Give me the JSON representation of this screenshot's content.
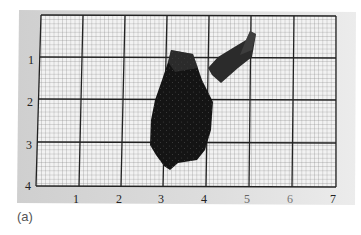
{
  "figure": {
    "caption": "(a)",
    "paper_color": "#d9d9d9",
    "grid_color": "#222222",
    "specimen_color": "#1a1a1a",
    "grid": {
      "columns": 7,
      "rows": 4,
      "x_labels": [
        "1",
        "2",
        "3",
        "4",
        "5",
        "6",
        "7"
      ],
      "y_labels": [
        "1",
        "2",
        "3",
        "4"
      ]
    },
    "objects": [
      {
        "name": "large-fragment",
        "label": "large dark fragment"
      },
      {
        "name": "small-fragment",
        "label": "small elongated fragment"
      }
    ]
  }
}
